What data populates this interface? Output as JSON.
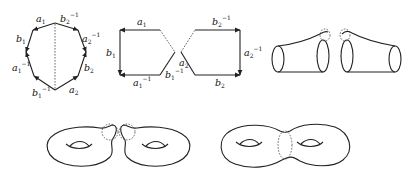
{
  "figure": {
    "panels": [
      {
        "id": "octagon",
        "description": "Genus-2 octagon with edge labels and dashed cut",
        "labels": {
          "a1": "a",
          "a1_sub": "1",
          "b2inv": "b",
          "b2inv_sub": "2",
          "b2inv_sup": "−1",
          "b1": "b",
          "b1_sub": "1",
          "a2inv": "a",
          "a2inv_sub": "2",
          "a2inv_sup": "−1",
          "a1inv": "a",
          "a1inv_sub": "1",
          "a1inv_sup": "−1",
          "b2": "b",
          "b2_sub": "2",
          "b1inv": "b",
          "b1inv_sub": "1",
          "b1inv_sup": "−1",
          "a2": "a",
          "a2_sub": "2"
        }
      },
      {
        "id": "split-hexagons",
        "description": "Octagon cut into two pentagons along edge a2",
        "labels": {
          "a1": "a",
          "a1_sub": "1",
          "b1": "b",
          "b1_sub": "1",
          "a1inv": "a",
          "a1inv_sub": "1",
          "a1inv_sup": "−1",
          "b1inv": "b",
          "b1inv_sub": "1",
          "b1inv_sup": "−1",
          "a2": "a",
          "a2_sub": "2",
          "b2inv": "b",
          "b2inv_sub": "2",
          "b2inv_sup": "−1",
          "a2inv": "a",
          "a2inv_sub": "2",
          "a2inv_sup": "−1",
          "b2": "b",
          "b2_sub": "2"
        }
      },
      {
        "id": "cylinders",
        "description": "Two tubes with glued boundary circles"
      },
      {
        "id": "two-tori",
        "description": "Two tori each with a disk removed"
      },
      {
        "id": "double-torus",
        "description": "Connected sum forming genus-2 surface"
      }
    ]
  },
  "colors": {
    "stroke": "#222222",
    "background": "#ffffff"
  }
}
